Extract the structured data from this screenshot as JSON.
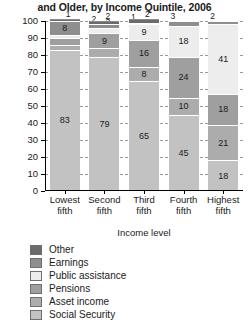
{
  "title": "and Older, by Income Quintile, 2006",
  "axis": {
    "y_title": "Percent",
    "x_title": "Income level",
    "y_ticks": [
      "100",
      "90",
      "80",
      "70",
      "60",
      "50",
      "40",
      "30",
      "20",
      "10",
      "0"
    ]
  },
  "legend": {
    "items": [
      {
        "label": "Other",
        "color": "#6b6b6b"
      },
      {
        "label": "Earnings",
        "color": "#8e8e8e"
      },
      {
        "label": "Public assistance",
        "color": "#ededed"
      },
      {
        "label": "Pensions",
        "color": "#9f9f9f"
      },
      {
        "label": "Asset income",
        "color": "#acacac"
      },
      {
        "label": "Social Security",
        "color": "#c2c2c2"
      }
    ]
  },
  "chart_data": {
    "type": "bar",
    "stacked": true,
    "title": "and Older, by Income Quintile, 2006",
    "xlabel": "Income level",
    "ylabel": "Percent",
    "ylim": [
      0,
      100
    ],
    "ytick_step": 10,
    "grid": true,
    "legend_position": "below",
    "categories": [
      "Lowest fifth",
      "Second fifth",
      "Third fifth",
      "Fourth fifth",
      "Highest fifth"
    ],
    "series": [
      {
        "name": "Social Security",
        "color": "#c2c2c2",
        "values": [
          83,
          79,
          65,
          45,
          18
        ]
      },
      {
        "name": "Asset income",
        "color": "#acacac",
        "values": [
          3,
          5,
          8,
          10,
          21
        ]
      },
      {
        "name": "Pensions",
        "color": "#9f9f9f",
        "values": [
          4,
          9,
          16,
          24,
          18
        ]
      },
      {
        "name": "Public assistance",
        "color": "#ededed",
        "values": [
          2,
          3,
          9,
          18,
          41
        ]
      },
      {
        "name": "Earnings",
        "color": "#8e8e8e",
        "values": [
          8,
          2,
          1,
          3,
          2
        ]
      },
      {
        "name": "Other",
        "color": "#6b6b6b",
        "values": [
          1,
          2,
          2,
          0,
          0
        ]
      }
    ]
  }
}
